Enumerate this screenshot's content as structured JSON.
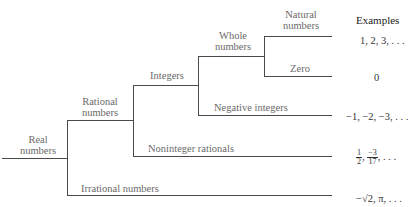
{
  "diagram": {
    "header": "Examples",
    "nodes": {
      "real": [
        "Real",
        "numbers"
      ],
      "rational": [
        "Rational",
        "numbers"
      ],
      "integers": "Integers",
      "whole": [
        "Whole",
        "numbers"
      ],
      "natural": [
        "Natural",
        "numbers"
      ],
      "zero": "Zero",
      "negative": "Negative integers",
      "noninteger": "Noninteger rationals",
      "irrational": "Irrational numbers"
    },
    "examples": {
      "natural": "1, 2, 3, . . .",
      "zero": "0",
      "negative": "−1, −2, −3, . . .",
      "noninteger": {
        "frac1_num": "1",
        "frac1_den": "2",
        "frac2_num": "−3",
        "frac2_den": "17",
        "tail": ", . . ."
      },
      "irrational": "−√2, π, . . ."
    }
  }
}
